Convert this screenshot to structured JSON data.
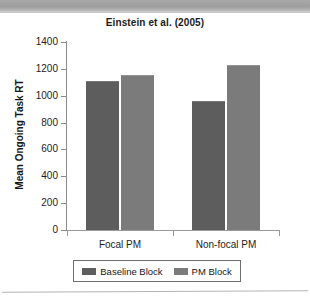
{
  "figure": {
    "title": "Einstein et al. (2005)",
    "legend_entries": [
      "Baseline Block",
      "PM Block"
    ]
  },
  "colors": {
    "series_baseline": "#5d5d5d",
    "series_pm": "#7b7b7b",
    "axis": "#8a8a8a",
    "text": "#1d1d1d",
    "scan_bar": "#a9a9a9"
  },
  "chart_data": {
    "type": "bar",
    "title": "Einstein et al. (2005)",
    "xlabel": "",
    "ylabel": "Mean Ongoing Task RT",
    "categories": [
      "Focal PM",
      "Non-focal PM"
    ],
    "series": [
      {
        "name": "Baseline Block",
        "values": [
          1100,
          955
        ]
      },
      {
        "name": "PM Block",
        "values": [
          1150,
          1220
        ]
      }
    ],
    "ylim": [
      0,
      1400
    ],
    "ytick_step": 200,
    "yticks": [
      0,
      200,
      400,
      600,
      800,
      1000,
      1200,
      1400
    ],
    "ytick_labels": [
      "0",
      "200",
      "400",
      "600",
      "800",
      "1000",
      "1200",
      "1400"
    ],
    "grid": false,
    "legend_position": "bottom"
  }
}
